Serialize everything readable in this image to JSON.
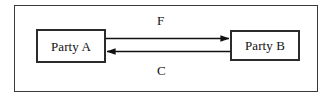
{
  "figure": {
    "width": 332,
    "height": 98,
    "background_color": "#ffffff",
    "frame": {
      "name": "outer-frame",
      "border_color": "#3a3a3a"
    }
  },
  "nodes": [
    {
      "id": "party-a",
      "label": "Party A",
      "border_color": "#2b2b2b",
      "fill_color": "#ffffff"
    },
    {
      "id": "party-b",
      "label": "Party B",
      "border_color": "#2b2b2b",
      "fill_color": "#ffffff"
    }
  ],
  "edges": [
    {
      "id": "edge-f",
      "label": "F",
      "from": "Party A",
      "to": "Party B",
      "direction": "right",
      "color": "#111111"
    },
    {
      "id": "edge-c",
      "label": "C",
      "from": "Party B",
      "to": "Party A",
      "direction": "left",
      "color": "#111111"
    }
  ]
}
